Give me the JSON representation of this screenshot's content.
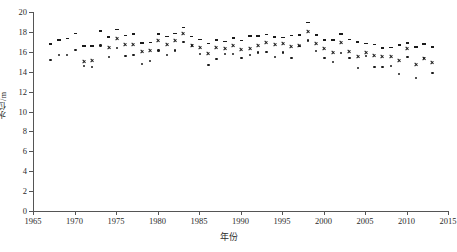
{
  "chart_data": {
    "type": "scatter",
    "title": "",
    "xlabel": "年份",
    "ylabel": "水位/m",
    "xlim": [
      1965,
      2015
    ],
    "ylim": [
      0,
      20
    ],
    "xticks": [
      1965,
      1970,
      1975,
      1980,
      1985,
      1990,
      1995,
      2000,
      2005,
      2010,
      2015
    ],
    "yticks": [
      0,
      2,
      4,
      6,
      8,
      10,
      12,
      14,
      16,
      18,
      20
    ],
    "grid": false,
    "legend": "none",
    "series": [
      {
        "name": "最高水位",
        "marker": "dash",
        "x": [
          1967,
          1968,
          1969,
          1970,
          1971,
          1972,
          1973,
          1974,
          1975,
          1976,
          1977,
          1978,
          1979,
          1980,
          1981,
          1982,
          1983,
          1984,
          1985,
          1986,
          1987,
          1988,
          1989,
          1990,
          1991,
          1992,
          1993,
          1994,
          1995,
          1996,
          1997,
          1998,
          1999,
          2000,
          2001,
          2002,
          2003,
          2004,
          2005,
          2006,
          2007,
          2008,
          2009,
          2010,
          2011,
          2012,
          2013
        ],
        "y": [
          16.9,
          17.3,
          17.45,
          17.95,
          16.7,
          16.7,
          18.2,
          17.6,
          18.35,
          17.75,
          17.9,
          17.0,
          17.05,
          17.9,
          17.65,
          17.95,
          18.55,
          17.65,
          17.35,
          16.95,
          17.3,
          17.15,
          17.5,
          17.25,
          17.7,
          17.7,
          17.85,
          17.6,
          17.55,
          17.75,
          17.8,
          19.05,
          17.8,
          17.3,
          17.3,
          17.9,
          17.35,
          17.1,
          16.95,
          16.85,
          16.5,
          16.55,
          16.8,
          17.0,
          16.6,
          16.9,
          16.6
        ]
      },
      {
        "name": "平均水位",
        "marker": "cross",
        "x": [
          1971,
          1972,
          1974,
          1975,
          1976,
          1977,
          1978,
          1979,
          1980,
          1981,
          1982,
          1983,
          1984,
          1985,
          1986,
          1987,
          1988,
          1989,
          1990,
          1991,
          1992,
          1993,
          1994,
          1995,
          1996,
          1997,
          1998,
          1999,
          2000,
          2001,
          2002,
          2003,
          2004,
          2005,
          2006,
          2007,
          2008,
          2009,
          2010,
          2011,
          2012,
          2013
        ],
        "y": [
          15.15,
          15.25,
          16.55,
          17.45,
          16.85,
          16.8,
          16.1,
          16.25,
          17.2,
          16.85,
          17.25,
          17.9,
          16.75,
          16.55,
          15.95,
          16.5,
          16.4,
          16.7,
          16.3,
          16.4,
          16.75,
          17.05,
          16.85,
          16.9,
          16.65,
          16.7,
          18.1,
          16.9,
          16.45,
          16.0,
          17.05,
          16.1,
          15.65,
          16.0,
          15.75,
          15.6,
          15.6,
          15.25,
          16.45,
          14.8,
          15.45,
          15.05
        ]
      },
      {
        "name": "最低水位",
        "marker": "dot",
        "x": [
          1967,
          1968,
          1969,
          1970,
          1971,
          1972,
          1973,
          1974,
          1975,
          1976,
          1977,
          1978,
          1979,
          1980,
          1981,
          1982,
          1983,
          1984,
          1985,
          1986,
          1987,
          1988,
          1989,
          1990,
          1991,
          1992,
          1993,
          1994,
          1995,
          1996,
          1997,
          1998,
          1999,
          2000,
          2001,
          2002,
          2003,
          2004,
          2005,
          2006,
          2007,
          2008,
          2009,
          2010,
          2011,
          2012,
          2013
        ],
        "y": [
          15.3,
          15.75,
          15.75,
          16.3,
          14.65,
          14.6,
          16.75,
          15.55,
          16.5,
          15.7,
          15.8,
          14.85,
          15.15,
          16.25,
          15.8,
          16.25,
          17.1,
          16.75,
          15.9,
          14.8,
          15.4,
          15.85,
          15.9,
          15.5,
          15.75,
          16.05,
          16.1,
          15.55,
          16.05,
          15.5,
          16.7,
          17.25,
          16.2,
          15.45,
          15.05,
          16.0,
          15.45,
          14.5,
          15.7,
          14.6,
          14.6,
          14.65,
          13.9,
          15.6,
          13.45,
          15.45,
          13.95
        ]
      }
    ]
  }
}
